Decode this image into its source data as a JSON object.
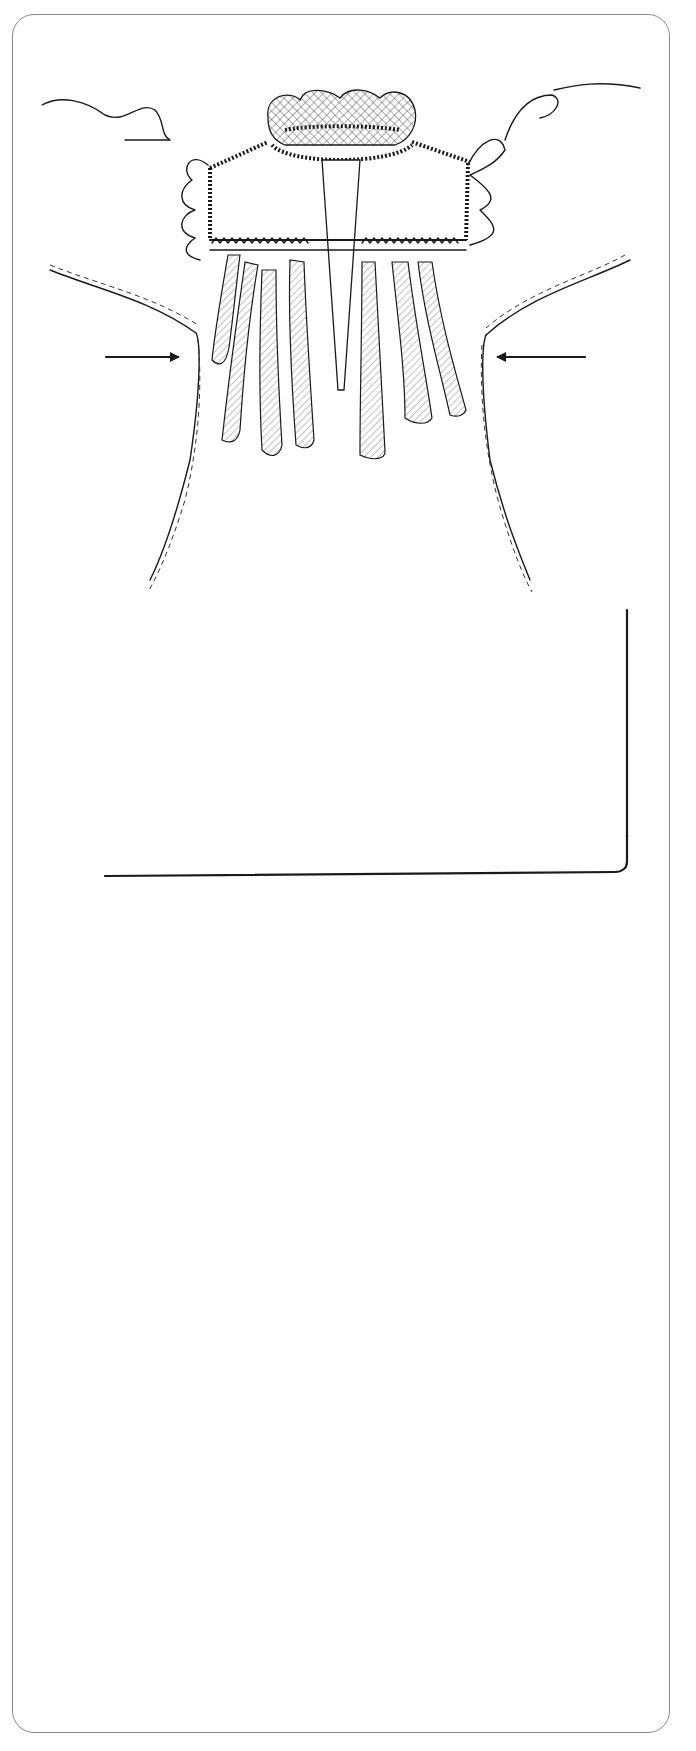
{
  "figures": [
    {
      "id": "figure-3",
      "caption": "Figure 3",
      "labels": {
        "left_stitch": "Stitch",
        "left_seam": "side seam",
        "right_stitch": "Stitch",
        "right_seam": "side seam"
      }
    },
    {
      "id": "figure-4",
      "caption": "Figure 4",
      "labels": {
        "lower_skirt": "Lower skirt",
        "press_and_hem": "Press and hem",
        "turn": "Turn",
        "under": "under ¹/₄′"
      }
    },
    {
      "id": "figure-5",
      "caption": "Figure 5",
      "labels": {
        "bow_line1": "Bow at",
        "bow_line2": "center of",
        "bow_line3": "elastic"
      }
    },
    {
      "id": "figure-6",
      "caption": "Figure 6",
      "labels": {
        "neckline": "Neckline",
        "weave_line1": "Weave floss in and",
        "weave_line2": "out of entredeux"
      }
    }
  ],
  "colors": {
    "ink": "#1a1a1a",
    "frame": "#8a8a8a",
    "background": "#ffffff"
  }
}
